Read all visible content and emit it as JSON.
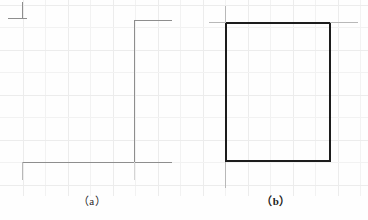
{
  "figure": {
    "background_color": "#fefefe",
    "grid": {
      "visible": true,
      "color": "#f2f2f2",
      "spacing_px": 22.5
    },
    "panels": [
      {
        "id": "a",
        "caption": "（a）",
        "description": "incomplete rectangle outline, light gray stroke, open left and top sides",
        "stroke_color": "#8e8e8e",
        "shape_type": "open-rectangle",
        "rect": {
          "x": 22,
          "y": 18,
          "width": 113,
          "height": 144
        },
        "segments": [
          {
            "name": "top-left-tick-vertical",
            "x": 22,
            "y": 2,
            "w": 1,
            "h": 17,
            "tone": "light"
          },
          {
            "name": "top-left-tick-horizontal",
            "x": 8,
            "y": 18,
            "w": 19,
            "h": 1,
            "tone": "light"
          },
          {
            "name": "top-right-horizontal",
            "x": 134,
            "y": 20,
            "w": 38,
            "h": 1,
            "tone": "light"
          },
          {
            "name": "right-vertical",
            "x": 134,
            "y": 20,
            "w": 1,
            "h": 143,
            "tone": "light"
          },
          {
            "name": "bottom-horizontal",
            "x": 22,
            "y": 162,
            "w": 150,
            "h": 1,
            "tone": "light"
          },
          {
            "name": "bottom-left-stub",
            "x": 22,
            "y": 162,
            "w": 1,
            "h": 18,
            "tone": "lighter"
          },
          {
            "name": "bottom-right-stub",
            "x": 134,
            "y": 162,
            "w": 1,
            "h": 18,
            "tone": "faint"
          }
        ]
      },
      {
        "id": "b",
        "caption": "（b）",
        "description": "complete closed rectangle outline, dark stroke",
        "stroke_color": "#1c1c1c",
        "shape_type": "closed-rectangle",
        "rect": {
          "x": 41,
          "y": 22,
          "width": 105,
          "height": 140
        },
        "segments": [
          {
            "name": "rect-top",
            "x": 41,
            "y": 22,
            "w": 106,
            "h": 2,
            "tone": "dark"
          },
          {
            "name": "rect-bottom",
            "x": 41,
            "y": 160,
            "w": 106,
            "h": 2,
            "tone": "dark"
          },
          {
            "name": "rect-left",
            "x": 41,
            "y": 22,
            "w": 2,
            "h": 140,
            "tone": "dark"
          },
          {
            "name": "rect-right",
            "x": 145,
            "y": 22,
            "w": 2,
            "h": 140,
            "tone": "dark"
          },
          {
            "name": "overshoot-top-left-v",
            "x": 41,
            "y": 6,
            "w": 1,
            "h": 17,
            "tone": "lighter"
          },
          {
            "name": "overshoot-top-left-h",
            "x": 25,
            "y": 22,
            "w": 17,
            "h": 1,
            "tone": "lighter"
          },
          {
            "name": "overshoot-top-right",
            "x": 146,
            "y": 22,
            "w": 28,
            "h": 1,
            "tone": "lighter"
          },
          {
            "name": "overshoot-bottom-left",
            "x": 41,
            "y": 162,
            "w": 1,
            "h": 26,
            "tone": "lighter"
          }
        ]
      }
    ]
  }
}
